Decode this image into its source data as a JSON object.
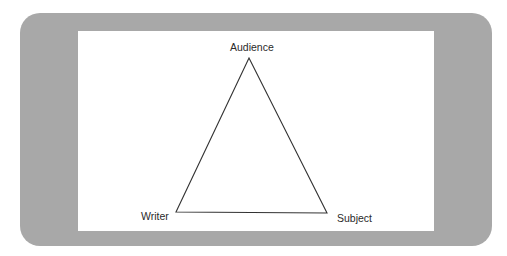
{
  "diagram": {
    "type": "rhetorical-triangle",
    "nodes": {
      "top": {
        "label": "Audience"
      },
      "left": {
        "label": "Writer"
      },
      "right": {
        "label": "Subject"
      }
    },
    "colors": {
      "frame": "#a8a8a8",
      "canvas": "#ffffff",
      "stroke": "#333333",
      "text": "#2a2a2a"
    }
  }
}
